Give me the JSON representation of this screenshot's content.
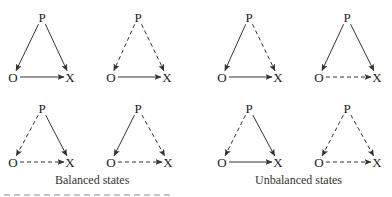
{
  "diagram": {
    "nodes": {
      "p": "P",
      "o": "O",
      "x": "X"
    },
    "legend": {
      "solid": "positive relation",
      "dashed": "negative relation"
    },
    "triangles": [
      {
        "id": "bal-1",
        "group": "balanced",
        "row": 0,
        "col": 0,
        "p_o": "solid",
        "p_x": "solid",
        "o_x": "solid",
        "P": [
          42,
          17
        ],
        "O": [
          13,
          77
        ],
        "X": [
          70,
          77
        ]
      },
      {
        "id": "bal-2",
        "group": "balanced",
        "row": 0,
        "col": 1,
        "p_o": "dashed",
        "p_x": "dashed",
        "o_x": "solid",
        "P": [
          138,
          17
        ],
        "O": [
          111,
          77
        ],
        "X": [
          167,
          77
        ]
      },
      {
        "id": "unb-1",
        "group": "unbalanced",
        "row": 0,
        "col": 2,
        "p_o": "solid",
        "p_x": "dashed",
        "o_x": "solid",
        "P": [
          249,
          17
        ],
        "O": [
          222,
          77
        ],
        "X": [
          278,
          77
        ]
      },
      {
        "id": "unb-2",
        "group": "unbalanced",
        "row": 0,
        "col": 3,
        "p_o": "solid",
        "p_x": "solid",
        "o_x": "dashed",
        "P": [
          347,
          17
        ],
        "O": [
          319,
          77
        ],
        "X": [
          377,
          77
        ]
      },
      {
        "id": "bal-3",
        "group": "balanced",
        "row": 1,
        "col": 0,
        "p_o": "dashed",
        "p_x": "solid",
        "o_x": "dashed",
        "P": [
          42,
          108
        ],
        "O": [
          13,
          162
        ],
        "X": [
          70,
          162
        ]
      },
      {
        "id": "bal-4",
        "group": "balanced",
        "row": 1,
        "col": 1,
        "p_o": "solid",
        "p_x": "dashed",
        "o_x": "dashed",
        "P": [
          138,
          108
        ],
        "O": [
          111,
          162
        ],
        "X": [
          168,
          162
        ]
      },
      {
        "id": "unb-3",
        "group": "unbalanced",
        "row": 1,
        "col": 2,
        "p_o": "dashed",
        "p_x": "solid",
        "o_x": "solid",
        "P": [
          249,
          108
        ],
        "O": [
          222,
          162
        ],
        "X": [
          278,
          162
        ]
      },
      {
        "id": "unb-4",
        "group": "unbalanced",
        "row": 1,
        "col": 3,
        "p_o": "dashed",
        "p_x": "dashed",
        "o_x": "dashed",
        "P": [
          347,
          108
        ],
        "O": [
          319,
          162
        ],
        "X": [
          377,
          162
        ]
      }
    ]
  },
  "captions": {
    "balanced": "Balanced states",
    "unbalanced": "Unbalanced states"
  },
  "colors": {
    "line": "#333333",
    "text": "#222222",
    "background": "#ffffff"
  }
}
